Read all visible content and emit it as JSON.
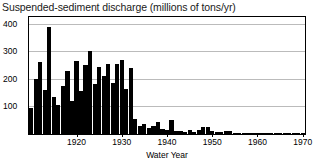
{
  "chart_data": {
    "type": "bar",
    "title": "Suspended-sediment discharge (millions of tons/yr)",
    "xlabel": "Water Year",
    "ylabel": "",
    "xlim": [
      1909.5,
      1970.5
    ],
    "ylim": [
      0,
      425
    ],
    "grid": true,
    "legend": null,
    "ytick_labels": [
      "400",
      "300",
      "200",
      "100"
    ],
    "ytick_values": [
      400,
      300,
      200,
      100
    ],
    "xtick_labels": [
      "1920",
      "1930",
      "1940",
      "1950",
      "1960",
      "1970"
    ],
    "xtick_values": [
      1920,
      1930,
      1940,
      1950,
      1960,
      1970
    ],
    "bar_color": "#000000",
    "categories": [
      1910,
      1911,
      1912,
      1913,
      1914,
      1915,
      1916,
      1917,
      1918,
      1919,
      1920,
      1921,
      1922,
      1923,
      1924,
      1925,
      1926,
      1927,
      1928,
      1929,
      1930,
      1931,
      1932,
      1933,
      1934,
      1935,
      1936,
      1937,
      1938,
      1939,
      1940,
      1941,
      1942,
      1943,
      1944,
      1945,
      1946,
      1947,
      1948,
      1949,
      1950,
      1951,
      1952,
      1953,
      1954,
      1955,
      1956,
      1957,
      1958,
      1959,
      1960,
      1961,
      1962,
      1963,
      1964,
      1965,
      1966,
      1967,
      1968,
      1969,
      1970
    ],
    "values": [
      95,
      200,
      260,
      160,
      390,
      135,
      105,
      175,
      230,
      120,
      265,
      155,
      250,
      300,
      180,
      245,
      210,
      255,
      185,
      255,
      270,
      165,
      240,
      55,
      30,
      35,
      22,
      28,
      42,
      18,
      14,
      52,
      12,
      10,
      9,
      14,
      8,
      16,
      24,
      26,
      10,
      7,
      6,
      10,
      12,
      5,
      4,
      3,
      4,
      3,
      5,
      3,
      2,
      3,
      3,
      2,
      3,
      2,
      2,
      2,
      3
    ]
  }
}
